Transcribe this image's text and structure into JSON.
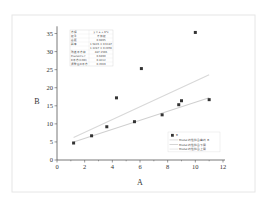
{
  "figure": {
    "frame_color": "#e6e6e6",
    "axis_color": "#555555",
    "point_color": "#333333",
    "fit_line_colors": [
      "#d8d8d8",
      "#d0d0d0",
      "#e4e4e4"
    ]
  },
  "stats_table": {
    "rows": [
      [
        "方程",
        "y = a + b*x"
      ],
      [
        "权重",
        "不加权"
      ],
      [
        "截距",
        "0.9495"
      ],
      [
        "斜率",
        "1.5826 ± 0.6187"
      ],
      [
        "",
        "1.1287 ± 0.2056"
      ],
      [
        "残差平方和",
        "487.1596"
      ],
      [
        "Pearson's r",
        "0.6490"
      ],
      [
        "R平方(COD)",
        "0.4212"
      ],
      [
        "调整后R平方",
        "0.3569"
      ]
    ]
  },
  "legend": {
    "items": [
      {
        "label": "B",
        "type": "marker"
      },
      {
        "label": "Model 线性拟合曲线 B",
        "type": "line"
      },
      {
        "label": "Model 线性拟合下限",
        "type": "line"
      },
      {
        "label": "Model 线性拟合上限",
        "type": "line"
      }
    ]
  },
  "chart_data": {
    "type": "scatter",
    "title": "",
    "xlabel": "A",
    "ylabel": "B",
    "xlim": [
      0,
      12
    ],
    "ylim": [
      0,
      37
    ],
    "xticks": [
      0,
      2,
      4,
      6,
      8,
      10,
      12
    ],
    "yticks": [
      0,
      5,
      10,
      15,
      20,
      25,
      30,
      35
    ],
    "grid": false,
    "legend_position": "lower right",
    "series": [
      {
        "name": "B",
        "type": "scatter",
        "x": [
          1.2,
          2.5,
          3.6,
          4.3,
          5.6,
          6.1,
          7.6,
          8.8,
          9.0,
          10.0,
          11.0
        ],
        "y": [
          4.7,
          6.7,
          9.2,
          17.2,
          10.6,
          25.3,
          12.5,
          15.3,
          16.4,
          35.3,
          16.7
        ]
      },
      {
        "name": "Fit line (upper)",
        "type": "line",
        "x": [
          1.2,
          11.0
        ],
        "y": [
          6.2,
          23.6
        ]
      },
      {
        "name": "Fit line (lower)",
        "type": "line",
        "x": [
          1.2,
          11.0
        ],
        "y": [
          5.0,
          17.2
        ]
      }
    ]
  }
}
